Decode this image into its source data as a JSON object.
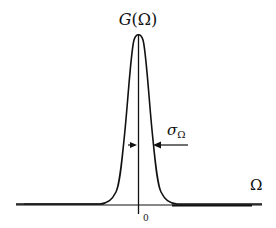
{
  "diagram": {
    "title": "G(Ω)",
    "title_function": "G",
    "title_arg": "(Ω)",
    "x_axis_label": "Ω",
    "origin_tick_label": "0",
    "width_label": "σ",
    "width_label_subscript": "Ω",
    "curve": "gaussian",
    "colors": {
      "line": "#111111",
      "background": "#ffffff"
    }
  }
}
